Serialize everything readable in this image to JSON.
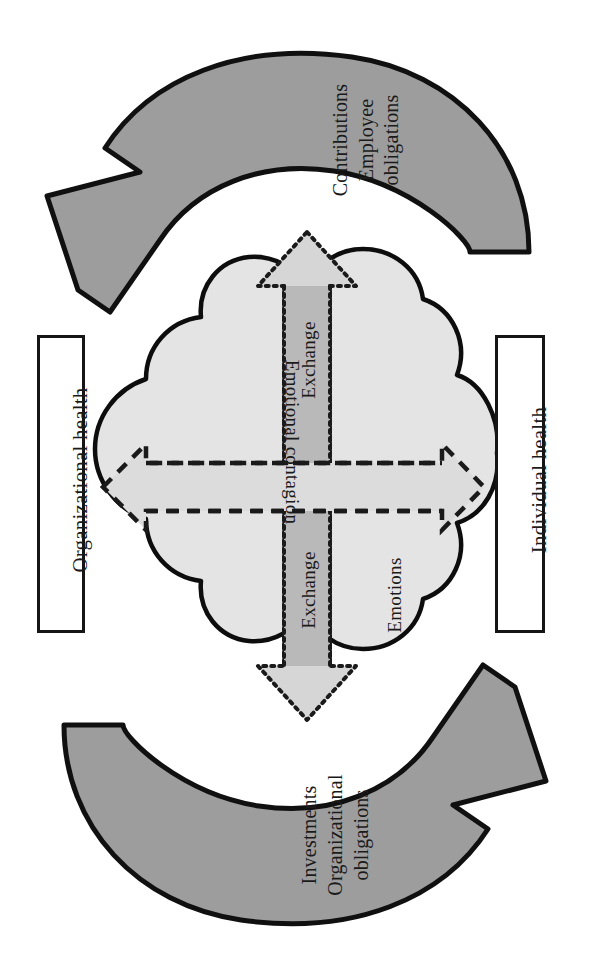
{
  "figure": {
    "type": "cycle-diagram",
    "title": "",
    "background_color": "#ffffff"
  },
  "boxes": {
    "left": {
      "label": "Organizational health",
      "name": "organizational-health-box"
    },
    "right": {
      "label": "Individual health",
      "name": "individual-health-box"
    }
  },
  "cycle_arrows": {
    "top": {
      "label_line1": "Contributions",
      "label_line2": "Employee",
      "label_line3": "obligations",
      "direction": "clockwise-from-right-to-left",
      "fill": "#9d9d9d",
      "stroke": "#101010"
    },
    "bottom": {
      "label_line1": "Investments",
      "label_line2": "Organizational",
      "label_line3": "obligations",
      "direction": "clockwise-from-left-to-right",
      "fill": "#9d9d9d",
      "stroke": "#101010"
    }
  },
  "cloud": {
    "name": "cloud-shape",
    "fill": "#e4e4e4",
    "stroke": "#0d0d0d"
  },
  "center": {
    "vertical_arrow": {
      "label_top": "Exchange",
      "label_bottom": "Exchange",
      "style": "double-headed dotted outline",
      "fill": "#d6d6d6",
      "shaft_fill": "#b9b9b9",
      "stroke": "#1a1a1a"
    },
    "horizontal_arrow": {
      "label": "Emotional contagion",
      "style": "double-headed dashed outline",
      "fill": "#dcdcdc",
      "stroke": "#1a1a1a"
    },
    "emotions_label": "Emotions"
  },
  "colors": {
    "ink": "#1a1a1a",
    "cycle_arrow_gray": "#9d9d9d",
    "cloud_gray": "#e4e4e4",
    "exchange_gray": "#d6d6d6"
  }
}
